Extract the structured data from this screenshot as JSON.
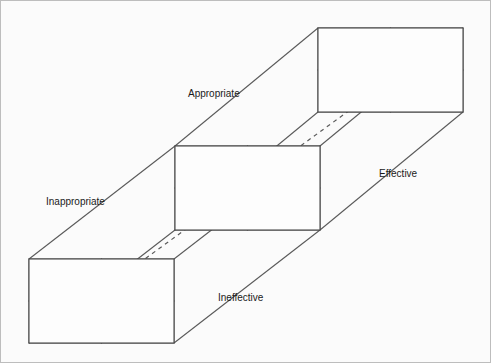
{
  "diagram": {
    "type": "3d-grid-cube",
    "colors": {
      "background": "#fbfbfb",
      "panel_fill": "#fdfdfd",
      "line": "#4a4a4a",
      "depth_line": "#5a5a5a",
      "text": "#1a1a1a"
    },
    "axis_labels": [
      {
        "id": "appropriate",
        "text": "Appropriate",
        "x": 188,
        "y": 97
      },
      {
        "id": "inappropriate",
        "text": "Inappropriate",
        "x": 46,
        "y": 205
      },
      {
        "id": "effective",
        "text": "Effective",
        "x": 379,
        "y": 177
      },
      {
        "id": "ineffective",
        "text": "Ineffective",
        "x": 218,
        "y": 301
      }
    ],
    "panels": [
      {
        "id": "top-panel",
        "name": "effective-styles-panel",
        "x": 318,
        "y": 28,
        "width": 145,
        "height": 84,
        "cells": [
          {
            "number": "1",
            "label": "Developer",
            "lines": [
              "Developer"
            ]
          },
          {
            "number": "2",
            "label": "Executive",
            "lines": [
              "Executive"
            ]
          },
          {
            "number": "3",
            "label": "Bureaucrat",
            "lines": [
              "Bureaucrat"
            ]
          },
          {
            "number": "4",
            "label": "Benevolent autocrat",
            "lines": [
              "Benevolent",
              "autocrat"
            ]
          }
        ]
      },
      {
        "id": "middle-panel",
        "name": "basic-styles-panel",
        "x": 175,
        "y": 146,
        "width": 145,
        "height": 84,
        "cells": [
          {
            "number": "1",
            "label": "Relayed",
            "lines": [
              "Relayed"
            ]
          },
          {
            "number": "2",
            "label": "Integrated",
            "lines": [
              "Integrated"
            ]
          },
          {
            "number": "3",
            "label": "Separated",
            "lines": [
              "Separated"
            ]
          },
          {
            "number": "4",
            "label": "Dedicated",
            "lines": [
              "Dedicated"
            ]
          }
        ]
      },
      {
        "id": "bottom-panel",
        "name": "ineffective-styles-panel",
        "x": 29,
        "y": 259,
        "width": 145,
        "height": 84,
        "cells": [
          {
            "number": "1",
            "label": "Missionary",
            "lines": [
              "Missionary"
            ]
          },
          {
            "number": "2",
            "label": "Compromiser",
            "lines": [
              "Compromiser"
            ]
          },
          {
            "number": "3",
            "label": "Deserter",
            "lines": [
              "Deserter"
            ]
          },
          {
            "number": "4",
            "label": "Autocrat",
            "lines": [
              "Autocrat"
            ]
          }
        ]
      }
    ],
    "dashed_diagonal": {
      "x1": 29,
      "y1": 343,
      "x2": 463,
      "y2": 28
    }
  }
}
